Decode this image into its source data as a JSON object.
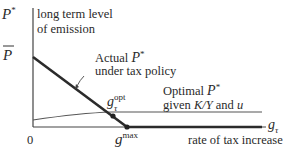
{
  "diagram": {
    "y_axis": {
      "symbol": "P",
      "symbol_sup": "*",
      "label_line1": "long term level",
      "label_line2": "of emission"
    },
    "y_tick": {
      "symbol": "P",
      "overline": true
    },
    "x_axis": {
      "symbol": "g",
      "symbol_sub": "τ",
      "label": "rate of tax increase",
      "origin": "0"
    },
    "x_tick": {
      "symbol": "g",
      "sup": "max"
    },
    "point_opt": {
      "symbol": "g",
      "sup": "opt",
      "sub": "τ"
    },
    "actual_curve": {
      "label_line1_prefix": "Actual ",
      "label_line1_symbol": "P",
      "label_line1_sup": "*",
      "label_line2": "under tax policy"
    },
    "optimal_curve": {
      "label_line1_prefix": "Optimal ",
      "label_line1_symbol": "P",
      "label_line1_sup": "*",
      "label_line2_prefix": "given ",
      "label_line2_var": "K/Y",
      "label_line2_mid": " and ",
      "label_line2_var2": "u"
    },
    "colors": {
      "axis": "#444444",
      "actual_line": "#2b2b2b",
      "optimal_line": "#555555",
      "text": "#2a2a2a"
    }
  }
}
